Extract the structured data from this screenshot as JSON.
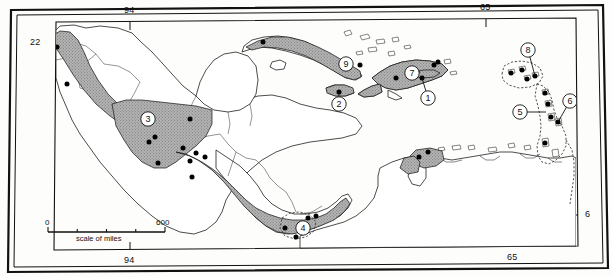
{
  "figure": {
    "type": "map",
    "title": "",
    "projection_frame": "double-ruled rectangular neatline",
    "background_color": "#fdfdfb",
    "land_outline_color": "#111111",
    "range_fill_color": "#a8a8a8",
    "site_dot_color": "#000000",
    "dashed_outline_color": "#333333"
  },
  "graticule": {
    "top_labels": [
      {
        "text": "94",
        "x": 130
      },
      {
        "text": "65",
        "x": 486
      }
    ],
    "bottom_labels": [
      {
        "text": "94",
        "x": 130
      },
      {
        "text": "65",
        "x": 513
      }
    ],
    "left_labels": [
      {
        "text": "22",
        "y": 43
      }
    ],
    "right_labels": [
      {
        "text": "6",
        "y": 215
      }
    ]
  },
  "scale_bar": {
    "min_label": "0",
    "max_label": "600",
    "caption": "scale of miles",
    "x_start": 48,
    "x_end": 165,
    "y": 229,
    "ticks": 4
  },
  "site_markers": [
    {
      "label": "1",
      "region": "Puerto Rico",
      "cx": 428,
      "cy": 98,
      "leader_to": [
        422,
        78
      ]
    },
    {
      "label": "2",
      "region": "Jamaica",
      "cx": 339,
      "cy": 104,
      "leader_to": [
        339,
        92
      ]
    },
    {
      "label": "3",
      "region": "Southern Mexico",
      "cx": 148,
      "cy": 119,
      "leader_to": null
    },
    {
      "label": "4",
      "region": "Panama",
      "cx": 303,
      "cy": 228,
      "leader_to": null
    },
    {
      "label": "5",
      "region": "Leeward Islands",
      "cx": 520,
      "cy": 112,
      "leader_to": [
        546,
        112
      ]
    },
    {
      "label": "6",
      "region": "Windward Islands",
      "cx": 570,
      "cy": 101,
      "leader_to": [
        558,
        122
      ]
    },
    {
      "label": "7",
      "region": "Hispaniola",
      "cx": 412,
      "cy": 73,
      "leader_to": null
    },
    {
      "label": "8",
      "region": "Virgin Islands",
      "cx": 528,
      "cy": 50,
      "leader_to": [
        535,
        76
      ]
    },
    {
      "label": "9",
      "region": "Eastern Cuba",
      "cx": 346,
      "cy": 64,
      "leader_to": null
    }
  ],
  "locality_dots": [
    {
      "x": 57,
      "y": 47
    },
    {
      "x": 67,
      "y": 84
    },
    {
      "x": 190,
      "y": 119
    },
    {
      "x": 155,
      "y": 137
    },
    {
      "x": 183,
      "y": 148
    },
    {
      "x": 196,
      "y": 153
    },
    {
      "x": 205,
      "y": 157
    },
    {
      "x": 149,
      "y": 142
    },
    {
      "x": 190,
      "y": 161
    },
    {
      "x": 158,
      "y": 163
    },
    {
      "x": 192,
      "y": 177
    },
    {
      "x": 308,
      "y": 218
    },
    {
      "x": 296,
      "y": 237
    },
    {
      "x": 285,
      "y": 228
    },
    {
      "x": 316,
      "y": 216
    },
    {
      "x": 263,
      "y": 42
    },
    {
      "x": 360,
      "y": 65
    },
    {
      "x": 339,
      "y": 92
    },
    {
      "x": 438,
      "y": 62
    },
    {
      "x": 396,
      "y": 78
    },
    {
      "x": 434,
      "y": 65
    },
    {
      "x": 417,
      "y": 72
    },
    {
      "x": 422,
      "y": 78
    },
    {
      "x": 511,
      "y": 73
    },
    {
      "x": 522,
      "y": 70
    },
    {
      "x": 527,
      "y": 79
    },
    {
      "x": 535,
      "y": 76
    },
    {
      "x": 545,
      "y": 93
    },
    {
      "x": 548,
      "y": 104
    },
    {
      "x": 551,
      "y": 117
    },
    {
      "x": 558,
      "y": 122
    },
    {
      "x": 545,
      "y": 143
    },
    {
      "x": 428,
      "y": 152
    },
    {
      "x": 419,
      "y": 157
    }
  ]
}
